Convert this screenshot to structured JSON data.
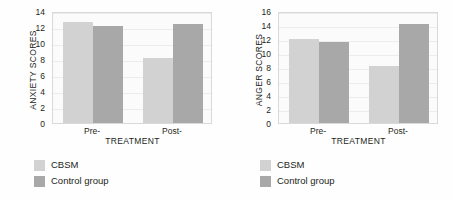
{
  "figure": {
    "background": "#fefefe",
    "panel_count": 2
  },
  "colors": {
    "cbsm": "#d2d2d2",
    "control": "#a8a8a8",
    "plot_background": "#fbfbfb",
    "gridline": "#ececec",
    "axis_border": "#d9d9d9",
    "text": "#231f20"
  },
  "chart_data": [
    {
      "type": "bar",
      "title": "",
      "xlabel": "TREATMENT",
      "ylabel": "ANXIETY SCORES",
      "categories": [
        "Pre-",
        "Post-"
      ],
      "series": [
        {
          "name": "CBSM",
          "values": [
            12.6,
            8.1
          ],
          "color": "#d2d2d2"
        },
        {
          "name": "Control group",
          "values": [
            12.1,
            12.4
          ],
          "color": "#a8a8a8"
        }
      ],
      "ylim": [
        0,
        14
      ],
      "ytick_step": 2,
      "yticks": [
        0,
        2,
        4,
        6,
        8,
        10,
        12,
        14
      ],
      "grid": true,
      "legend_position": "below-left"
    },
    {
      "type": "bar",
      "title": "",
      "xlabel": "TREATMENT",
      "ylabel": "ANGER SCORES",
      "categories": [
        "Pre-",
        "Post-"
      ],
      "series": [
        {
          "name": "CBSM",
          "values": [
            12.0,
            8.1
          ],
          "color": "#d2d2d2"
        },
        {
          "name": "Control group",
          "values": [
            11.6,
            14.2
          ],
          "color": "#a8a8a8"
        }
      ],
      "ylim": [
        0,
        16
      ],
      "ytick_step": 2,
      "yticks": [
        0,
        2,
        4,
        6,
        8,
        10,
        12,
        14,
        16
      ],
      "grid": true,
      "legend_position": "below-left"
    }
  ]
}
